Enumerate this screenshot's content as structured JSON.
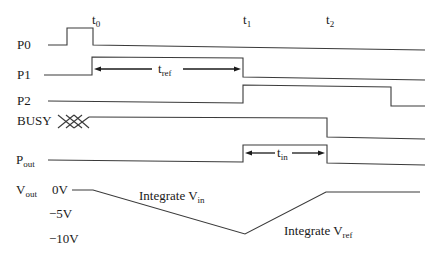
{
  "diagram": {
    "type": "timing-diagram",
    "time_markers": [
      {
        "base": "t",
        "sub": "0"
      },
      {
        "base": "t",
        "sub": "1"
      },
      {
        "base": "t",
        "sub": "2"
      }
    ],
    "signals": [
      {
        "name": "P0",
        "base": "P0",
        "sub": ""
      },
      {
        "name": "P1",
        "base": "P1",
        "sub": ""
      },
      {
        "name": "P2",
        "base": "P2",
        "sub": ""
      },
      {
        "name": "BUSY",
        "base": "BUSY",
        "sub": ""
      },
      {
        "name": "Pout",
        "base": "P",
        "sub": "out"
      },
      {
        "name": "Vout",
        "base": "V",
        "sub": "out"
      }
    ],
    "intervals": {
      "t_ref": {
        "base": "t",
        "sub": "ref"
      },
      "t_in": {
        "base": "t",
        "sub": "in"
      }
    },
    "voltage_levels": [
      "0V",
      "−5V",
      "−10V"
    ],
    "annotations": {
      "integrate_vin": {
        "text": "Integrate V",
        "sub": "in"
      },
      "integrate_vref": {
        "text": "Integrate V",
        "sub": "ref"
      }
    },
    "colors": {
      "line": "#333333",
      "text": "#1a1a1a",
      "background": "#ffffff"
    }
  }
}
